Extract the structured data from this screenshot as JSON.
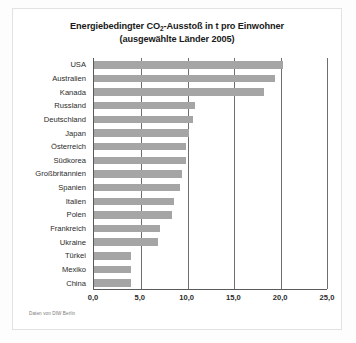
{
  "figure": {
    "title_line1_pre": "Energiebedingter CO",
    "title_line1_sub": "2",
    "title_line1_post": "-Ausstoß in t pro Einwohner",
    "title_line2": "(ausgewählte Länder 2005)",
    "source": "Daten von DIW Berlin",
    "bar_color": "#a5a5a5",
    "axis_color": "#5a5a5a",
    "grid_color": "#6e6e6e",
    "background": "#ffffff"
  },
  "chart_data": {
    "type": "bar",
    "orientation": "horizontal",
    "title": "Energiebedingter CO2-Ausstoß in t pro Einwohner (ausgewählte Länder 2005)",
    "xlabel": "",
    "ylabel": "",
    "xlim": [
      0,
      25
    ],
    "xticks": [
      0,
      5,
      10,
      15,
      20,
      25
    ],
    "xtick_labels": [
      "0,0",
      "5,0",
      "10,0",
      "15,0",
      "20,0",
      "25,0"
    ],
    "grid": true,
    "legend": "none",
    "unit": "t CO2 pro Einwohner",
    "year": 2005,
    "categories": [
      "USA",
      "Australien",
      "Kanada",
      "Russland",
      "Deutschland",
      "Japan",
      "Österreich",
      "Südkorea",
      "Großbritannien",
      "Spanien",
      "Italien",
      "Polen",
      "Frankreich",
      "Ukraine",
      "Türkei",
      "Mexiko",
      "China"
    ],
    "values": [
      20.2,
      19.3,
      18.2,
      10.8,
      10.6,
      10.1,
      9.8,
      9.8,
      9.4,
      9.2,
      8.5,
      8.3,
      7.1,
      6.8,
      3.9,
      3.9,
      3.9
    ],
    "source_note": "Daten von DIW Berlin"
  }
}
